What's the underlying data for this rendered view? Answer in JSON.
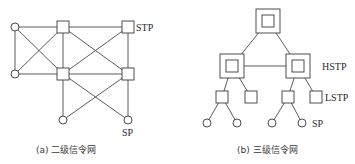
{
  "diagram_a": {
    "caption": "(a) 二级信令网",
    "labels": {
      "stp": "STP",
      "sp": "SP"
    },
    "nodes": [
      {
        "id": "sp1",
        "type": "circle",
        "x": 15,
        "y": 27
      },
      {
        "id": "sp2",
        "type": "circle",
        "x": 15,
        "y": 74
      },
      {
        "id": "stp1",
        "type": "square",
        "x": 63,
        "y": 27
      },
      {
        "id": "stp2",
        "type": "square",
        "x": 128,
        "y": 27
      },
      {
        "id": "stp3",
        "type": "square",
        "x": 63,
        "y": 74
      },
      {
        "id": "stp4",
        "type": "square",
        "x": 128,
        "y": 74
      },
      {
        "id": "sp3",
        "type": "circle",
        "x": 63,
        "y": 120
      },
      {
        "id": "sp4",
        "type": "circle",
        "x": 128,
        "y": 120
      }
    ]
  },
  "diagram_b": {
    "caption": "(b) 三级信令网",
    "labels": {
      "hstp": "HSTP",
      "lstp": "LSTP",
      "sp": "SP"
    },
    "nodes": [
      {
        "id": "top",
        "type": "double-square",
        "x": 268,
        "y": 21
      },
      {
        "id": "hstp1",
        "type": "double-square",
        "x": 232,
        "y": 66
      },
      {
        "id": "hstp2",
        "type": "double-square",
        "x": 298,
        "y": 66
      },
      {
        "id": "lstp1",
        "type": "square",
        "x": 222,
        "y": 97
      },
      {
        "id": "lstp2",
        "type": "square",
        "x": 251,
        "y": 97
      },
      {
        "id": "lstp3",
        "type": "square",
        "x": 288,
        "y": 97
      },
      {
        "id": "lstp4",
        "type": "square",
        "x": 316,
        "y": 97
      },
      {
        "id": "sp1",
        "type": "circle",
        "x": 207,
        "y": 123
      },
      {
        "id": "sp2",
        "type": "circle",
        "x": 237,
        "y": 123
      },
      {
        "id": "sp3",
        "type": "circle",
        "x": 272,
        "y": 123
      },
      {
        "id": "sp4",
        "type": "circle",
        "x": 302,
        "y": 123
      }
    ]
  }
}
